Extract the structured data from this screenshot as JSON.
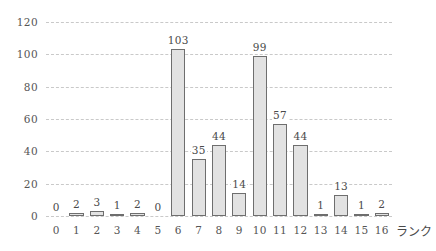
{
  "chart_data": {
    "type": "bar",
    "title": "",
    "subtitle": "",
    "xlabel": "ランク",
    "ylabel": "",
    "categories": [
      "0",
      "1",
      "2",
      "3",
      "4",
      "5",
      "6",
      "7",
      "8",
      "9",
      "10",
      "11",
      "12",
      "13",
      "14",
      "15",
      "16"
    ],
    "values": [
      0,
      2,
      3,
      1,
      2,
      0,
      103,
      35,
      44,
      14,
      99,
      57,
      44,
      1,
      13,
      1,
      2
    ],
    "data_labels": [
      "0",
      "2",
      "3",
      "1",
      "2",
      "0",
      "103",
      "35",
      "44",
      "14",
      "99",
      "57",
      "44",
      "1",
      "13",
      "1",
      "2"
    ],
    "xlim": [
      -0.5,
      16.5
    ],
    "ylim": [
      0,
      120
    ],
    "yticks": [
      0,
      20,
      40,
      60,
      80,
      100,
      120
    ],
    "ytick_labels": [
      "0",
      "20",
      "40",
      "60",
      "80",
      "100",
      "120"
    ],
    "xtick_labels": [
      "0",
      "1",
      "2",
      "3",
      "4",
      "5",
      "6",
      "7",
      "8",
      "9",
      "10",
      "11",
      "12",
      "13",
      "14",
      "15",
      "16"
    ],
    "grid": true,
    "grid_axis": "y",
    "grid_style": "dashed",
    "legend": false,
    "legend_position": "none",
    "bar_fill_color": "#e2e2e2",
    "bar_border_color": "#6e6e6e",
    "grid_color": "#c9c9c9",
    "text_color": "#4a4a4a",
    "background_color": "#ffffff"
  }
}
